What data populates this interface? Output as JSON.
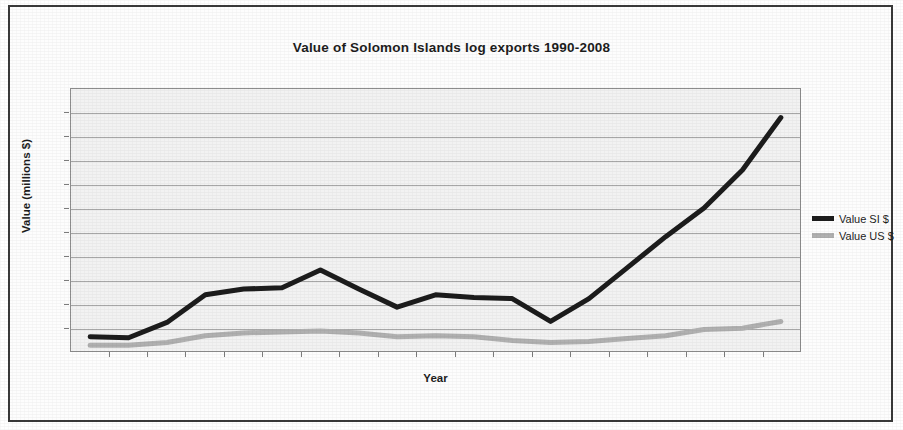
{
  "figure": {
    "title": "Value of Solomon Islands log exports 1990-2008"
  },
  "axes": {
    "y_label": "Value (millions $)",
    "x_label": "Year"
  },
  "legend": {
    "position": "right",
    "entries": [
      {
        "label": "Value SI $",
        "color": "#1c1c1c"
      },
      {
        "label": "Value US $",
        "color": "#b0b0b0"
      }
    ]
  },
  "chart_data": {
    "type": "line",
    "title": "Value of Solomon Islands log exports 1990-2008",
    "xlabel": "Year",
    "ylabel": "Value (millions $)",
    "grid": true,
    "legend_position": "right",
    "x": [
      1990,
      1991,
      1992,
      1993,
      1994,
      1995,
      1996,
      1997,
      1998,
      1999,
      2000,
      2001,
      2002,
      2003,
      2004,
      2005,
      2006,
      2007,
      2008
    ],
    "categories": [
      "1990",
      "1991",
      "1992",
      "1993",
      "1994",
      "1995",
      "1996",
      "1997",
      "1998",
      "1999",
      "2000",
      "2001",
      "2002",
      "2003",
      "2004",
      "2005",
      "2006",
      "2007",
      "2008"
    ],
    "ylim": [
      0,
      550
    ],
    "y_gridline_values": [
      0,
      50,
      100,
      150,
      200,
      250,
      300,
      350,
      400,
      450,
      500,
      550
    ],
    "series": [
      {
        "name": "Value SI $",
        "color": "#1c1c1c",
        "values": [
          30,
          28,
          60,
          118,
          130,
          133,
          170,
          130,
          92,
          118,
          112,
          110,
          62,
          110,
          175,
          240,
          300,
          380,
          490
        ]
      },
      {
        "name": "Value US $",
        "color": "#b0b0b0",
        "values": [
          12,
          12,
          18,
          32,
          38,
          40,
          42,
          38,
          30,
          32,
          30,
          22,
          18,
          20,
          26,
          32,
          45,
          48,
          62
        ]
      }
    ]
  }
}
